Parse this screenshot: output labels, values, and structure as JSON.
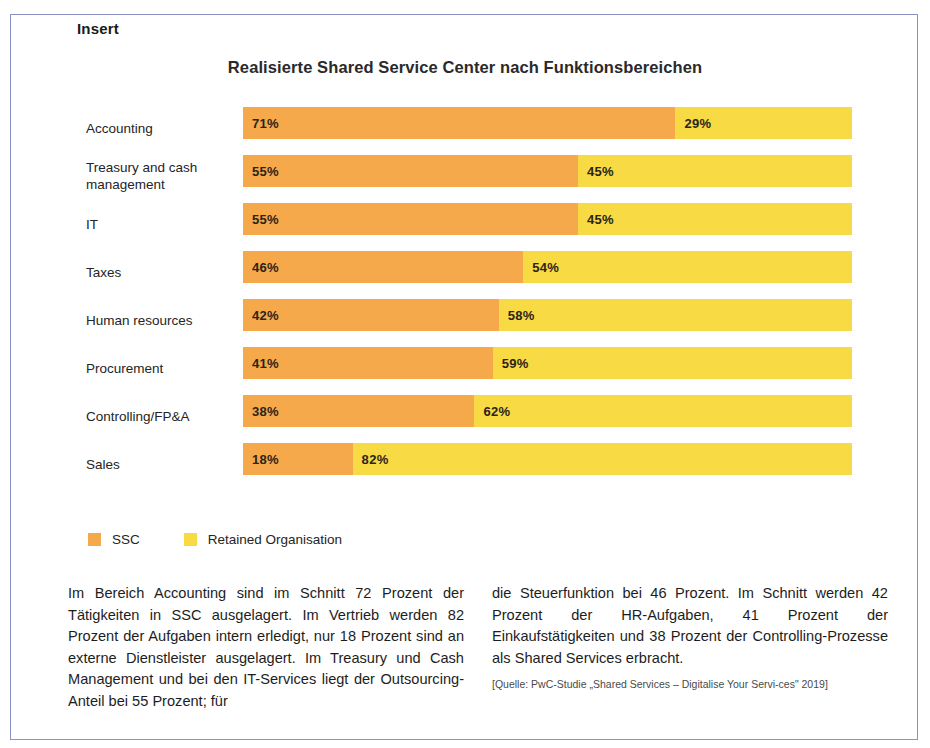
{
  "frame": {
    "legend_label": "Insert"
  },
  "chart_data": {
    "type": "bar",
    "orientation": "horizontal",
    "stacked": true,
    "normalized": true,
    "title": "Realisierte Shared Service Center nach Funktionsbereichen",
    "xlabel": "",
    "ylabel": "",
    "xlim": [
      0,
      100
    ],
    "grid": false,
    "legend_position": "bottom-left",
    "categories": [
      "Accounting",
      "Treasury and cash management",
      "IT",
      "Taxes",
      "Human resources",
      "Procurement",
      "Controlling/FP&A",
      "Sales"
    ],
    "series": [
      {
        "name": "SSC",
        "color": "#f5a94a",
        "values": [
          71,
          55,
          55,
          46,
          42,
          41,
          38,
          18
        ],
        "labels": [
          "71%",
          "55%",
          "55%",
          "46%",
          "42%",
          "41%",
          "38%",
          "18%"
        ]
      },
      {
        "name": "Retained Organisation",
        "color": "#f8da44",
        "values": [
          29,
          45,
          45,
          54,
          58,
          59,
          62,
          82
        ],
        "labels": [
          "29%",
          "45%",
          "45%",
          "54%",
          "58%",
          "59%",
          "62%",
          "82%"
        ]
      }
    ]
  },
  "text": {
    "left_column": "Im Bereich Accounting sind im Schnitt 72 Prozent der Tätigkeiten in SSC ausgelagert. Im Vertrieb werden 82 Prozent der Aufgaben intern erledigt, nur 18 Prozent sind an exter­ne Dienstleister ausgelagert. Im Treasury und Cash Management und bei den IT-Services liegt der Outsourcing-Anteil bei 55 Prozent; für",
    "right_column": "die Steuerfunktion bei 46 Prozent. Im Schnitt werden 42 Prozent der HR-Aufgaben, 41 Prozent der Einkaufstätigkeiten und 38 Prozent der Controlling-Prozesse als Shared Services erbracht.",
    "source": "[Quelle: PwC-Studie „Shared Services – Digitalise Your Servi-ces\" 2019]"
  },
  "colors": {
    "ssc": "#f5a94a",
    "retained": "#f8da44",
    "frame_border": "#8b93c4"
  }
}
